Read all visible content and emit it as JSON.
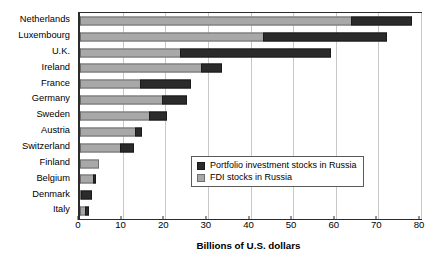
{
  "chart_data": {
    "type": "bar",
    "orientation": "horizontal",
    "stacked": true,
    "title": "",
    "xlabel": "Billions of U.S. dollars",
    "ylabel": "",
    "xlim": [
      0,
      80
    ],
    "xticks": [
      0,
      10,
      20,
      30,
      40,
      50,
      60,
      70,
      80
    ],
    "grid": true,
    "grid_axis": "x",
    "legend_position": "inside-lower-right",
    "categories": [
      "Netherlands",
      "Luxembourg",
      "U.K.",
      "Ireland",
      "France",
      "Germany",
      "Sweden",
      "Austria",
      "Switzerland",
      "Finland",
      "Belgium",
      "Denmark",
      "Italy"
    ],
    "series": [
      {
        "name": "FDI stocks in Russia",
        "color": "#a8a8a8",
        "values": [
          63.5,
          43.0,
          23.5,
          28.5,
          14.0,
          19.3,
          16.2,
          13.0,
          9.5,
          4.5,
          3.0,
          0.2,
          1.2
        ]
      },
      {
        "name": "Portfolio investment stocks in Russia",
        "color": "#2b2b2b",
        "values": [
          14.5,
          29.0,
          35.5,
          4.8,
          12.0,
          5.7,
          4.2,
          1.5,
          3.2,
          0.0,
          0.7,
          2.5,
          0.8
        ]
      }
    ],
    "totals": [
      78.0,
      72.0,
      59.0,
      33.3,
      26.0,
      25.0,
      20.4,
      14.5,
      12.7,
      4.5,
      3.7,
      2.7,
      2.0
    ]
  },
  "legend": {
    "items": [
      {
        "label": "Portfolio investment stocks in Russia",
        "swatch": "pf"
      },
      {
        "label": "FDI stocks in Russia",
        "swatch": "fdi"
      }
    ]
  }
}
